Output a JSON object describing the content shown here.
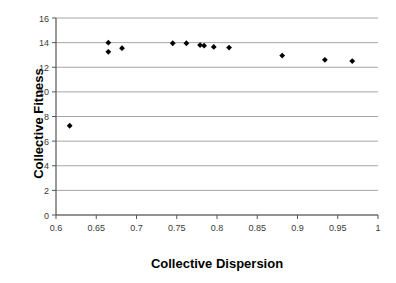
{
  "chart_data": {
    "type": "scatter",
    "title": "",
    "xlabel": "Collective Dispersion",
    "ylabel": "Collective Fitness",
    "xlim": [
      0.6,
      1.0
    ],
    "ylim": [
      0,
      16
    ],
    "xticks": [
      0.6,
      0.65,
      0.7,
      0.75,
      0.8,
      0.85,
      0.9,
      0.95,
      1
    ],
    "xtick_labels": [
      "0.6",
      "0.65",
      "0.7",
      "0.75",
      "0.8",
      "0.85",
      "0.9",
      "0.95",
      "1"
    ],
    "yticks": [
      0,
      2,
      4,
      6,
      8,
      10,
      12,
      14,
      16
    ],
    "ytick_labels": [
      "0",
      "2",
      "4",
      "6",
      "8",
      "10",
      "12",
      "14",
      "16"
    ],
    "grid": "horizontal",
    "legend": "none",
    "marker": "diamond",
    "marker_color": "#000000",
    "gridline_color": "#a6a6a6",
    "axis_color": "#555555",
    "points": [
      {
        "x": 0.617,
        "y": 7.25
      },
      {
        "x": 0.665,
        "y": 14.0
      },
      {
        "x": 0.665,
        "y": 13.25
      },
      {
        "x": 0.682,
        "y": 13.55
      },
      {
        "x": 0.745,
        "y": 13.95
      },
      {
        "x": 0.762,
        "y": 13.95
      },
      {
        "x": 0.779,
        "y": 13.8
      },
      {
        "x": 0.784,
        "y": 13.75
      },
      {
        "x": 0.796,
        "y": 13.65
      },
      {
        "x": 0.815,
        "y": 13.6
      },
      {
        "x": 0.881,
        "y": 12.95
      },
      {
        "x": 0.934,
        "y": 12.6
      },
      {
        "x": 0.968,
        "y": 12.5
      }
    ]
  }
}
